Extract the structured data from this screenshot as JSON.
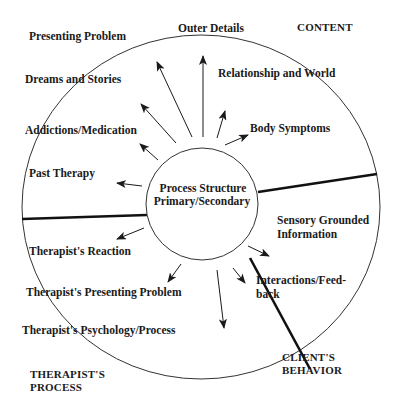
{
  "diagram": {
    "center": {
      "line1": "Process Structure",
      "line2": "Primary/Secondary"
    },
    "sections": {
      "content": "CONTENT",
      "clients_behavior": {
        "line1": "CLIENT'S",
        "line2": "BEHAVIOR"
      },
      "therapists_process": {
        "line1": "THERAPIST'S",
        "line2": "PROCESS"
      }
    },
    "content_items": [
      "Presenting Problem",
      "Outer Details",
      "Relationship and World",
      "Dreams and Stories",
      "Addictions/Medication",
      "Body Symptoms",
      "Past Therapy"
    ],
    "client_behavior_items": {
      "sensory": {
        "line1": "Sensory Grounded",
        "line2": "Information"
      },
      "interactions": {
        "line1": "Interactions/Feed-",
        "line2": "back"
      }
    },
    "therapist_items": [
      "Therapist's Reaction",
      "Therapist's Presenting Problem",
      "Therapist's Psychology/Process"
    ],
    "colors": {
      "ink": "#1a1a1a",
      "background": "#ffffff"
    }
  }
}
